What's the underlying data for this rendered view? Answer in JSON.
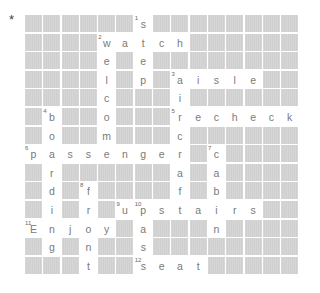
{
  "marker": "*",
  "grid": {
    "rows": 14,
    "cols": 15,
    "cells": [
      [
        null,
        null,
        null,
        null,
        null,
        null,
        {
          "l": "s",
          "n": "1"
        },
        null,
        null,
        null,
        null,
        null,
        null,
        null,
        null
      ],
      [
        null,
        null,
        null,
        null,
        {
          "l": "w",
          "n": "2"
        },
        {
          "l": "a"
        },
        {
          "l": "t"
        },
        {
          "l": "c"
        },
        {
          "l": "h"
        },
        null,
        null,
        null,
        null,
        null,
        null
      ],
      [
        null,
        null,
        null,
        null,
        {
          "l": "e"
        },
        null,
        {
          "l": "e"
        },
        null,
        null,
        null,
        null,
        null,
        null,
        null,
        null
      ],
      [
        null,
        null,
        null,
        null,
        {
          "l": "l"
        },
        null,
        {
          "l": "p"
        },
        null,
        {
          "l": "a",
          "n": "3"
        },
        {
          "l": "i"
        },
        {
          "l": "s"
        },
        {
          "l": "l"
        },
        {
          "l": "e"
        },
        null,
        null
      ],
      [
        null,
        null,
        null,
        null,
        {
          "l": "c"
        },
        null,
        null,
        null,
        {
          "l": "i"
        },
        null,
        null,
        null,
        null,
        null,
        null
      ],
      [
        null,
        {
          "l": "b",
          "n": "4"
        },
        null,
        null,
        {
          "l": "o"
        },
        null,
        null,
        null,
        {
          "l": "r",
          "n": "5"
        },
        {
          "l": "e"
        },
        {
          "l": "c"
        },
        {
          "l": "h"
        },
        {
          "l": "e"
        },
        {
          "l": "c"
        },
        {
          "l": "k"
        }
      ],
      [
        null,
        {
          "l": "o"
        },
        null,
        null,
        {
          "l": "m"
        },
        null,
        null,
        null,
        {
          "l": "c"
        },
        null,
        null,
        null,
        null,
        null,
        null
      ],
      [
        {
          "l": "p",
          "n": "6"
        },
        {
          "l": "a"
        },
        {
          "l": "s"
        },
        {
          "l": "s"
        },
        {
          "l": "e"
        },
        {
          "l": "n"
        },
        {
          "l": "g"
        },
        {
          "l": "e"
        },
        {
          "l": "r"
        },
        null,
        {
          "l": "c",
          "n": "7"
        },
        null,
        null,
        null,
        null
      ],
      [
        null,
        {
          "l": "r"
        },
        null,
        null,
        null,
        null,
        null,
        null,
        {
          "l": "a"
        },
        null,
        {
          "l": "a"
        },
        null,
        null,
        null,
        null
      ],
      [
        null,
        {
          "l": "d"
        },
        null,
        {
          "l": "f",
          "n": "8"
        },
        null,
        null,
        null,
        null,
        {
          "l": "f"
        },
        null,
        {
          "l": "b"
        },
        null,
        null,
        null,
        null
      ],
      [
        null,
        {
          "l": "i"
        },
        null,
        {
          "l": "r"
        },
        null,
        {
          "l": "u",
          "n": "9"
        },
        {
          "l": "p",
          "n": "10"
        },
        {
          "l": "s"
        },
        {
          "l": "t"
        },
        {
          "l": "a"
        },
        {
          "l": "i"
        },
        {
          "l": "r"
        },
        {
          "l": "s"
        },
        null,
        null
      ],
      [
        {
          "l": "E",
          "n": "11"
        },
        {
          "l": "n"
        },
        {
          "l": "j"
        },
        {
          "l": "o"
        },
        {
          "l": "y"
        },
        null,
        {
          "l": "a"
        },
        null,
        null,
        null,
        {
          "l": "n"
        },
        null,
        null,
        null,
        null
      ],
      [
        null,
        {
          "l": "g"
        },
        null,
        {
          "l": "n"
        },
        null,
        null,
        {
          "l": "s"
        },
        null,
        null,
        null,
        null,
        null,
        null,
        null,
        null
      ],
      [
        null,
        null,
        null,
        {
          "l": "t"
        },
        null,
        null,
        {
          "l": "s",
          "n": "12"
        },
        {
          "l": "e"
        },
        {
          "l": "a"
        },
        {
          "l": "t"
        },
        null,
        null,
        null,
        null,
        null
      ]
    ]
  },
  "words": {
    "across": [
      "watch",
      "aisle",
      "recheck",
      "passenger",
      "upstairs",
      "Enjoy",
      "seat"
    ],
    "down": [
      "step",
      "welcome",
      "aircraft",
      "boarding",
      "cabin",
      "front",
      "pass"
    ]
  }
}
